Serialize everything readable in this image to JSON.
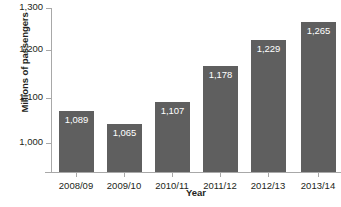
{
  "chart_data": {
    "type": "bar",
    "title": "",
    "xlabel": "Year",
    "ylabel": "Millions of passengers",
    "categories": [
      "2008/09",
      "2009/10",
      "2010/11",
      "2011/12",
      "2012/13",
      "2013/14"
    ],
    "values": [
      1089,
      1065,
      1107,
      1178,
      1229,
      1265
    ],
    "value_labels": [
      "1,089",
      "1,065",
      "1,107",
      "1,178",
      "1,229",
      "1,265"
    ],
    "ylim": [
      970,
      1300
    ],
    "yticks": [
      1000,
      1100,
      1200,
      1300
    ],
    "ytick_labels": [
      "1,000",
      "1,100",
      "1,200",
      "1,300"
    ],
    "grid": false,
    "legend": null,
    "bar_color": "#5f5f5f",
    "value_label_color": "#ffffff",
    "axis_color": "#a8a8a8",
    "background_color": "#ffffff"
  },
  "caption_fragment": ""
}
